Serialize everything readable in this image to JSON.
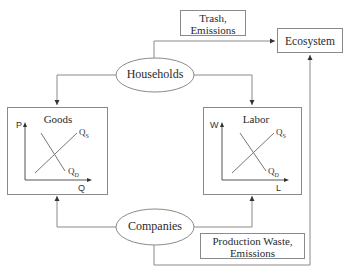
{
  "nodes": {
    "households": {
      "label": "Households"
    },
    "companies": {
      "label": "Companies"
    },
    "ecosystem": {
      "label": "Ecosystem"
    },
    "trash": {
      "line1": "Trash,",
      "line2": "Emissions"
    },
    "production_waste": {
      "line1": "Production Waste,",
      "line2": "Emissions"
    }
  },
  "markets": {
    "goods": {
      "title": "Goods",
      "y_axis": "P",
      "x_axis": "Q",
      "supply": {
        "main": "Q",
        "sub": "S"
      },
      "demand": {
        "main": "Q",
        "sub": "D"
      }
    },
    "labor": {
      "title": "Labor",
      "y_axis": "W",
      "x_axis": "L",
      "supply": {
        "main": "Q",
        "sub": "S"
      },
      "demand": {
        "main": "Q",
        "sub": "D"
      }
    }
  },
  "colors": {
    "line": "#8a8a8a",
    "text": "#2a2a2a",
    "arrow": "#333333"
  }
}
